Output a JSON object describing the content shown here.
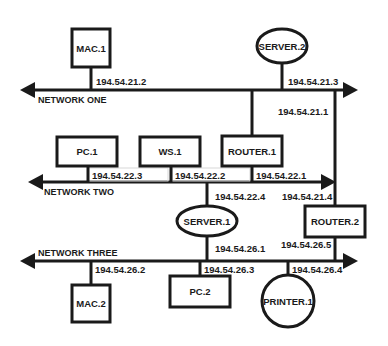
{
  "diagram": {
    "type": "network-topology",
    "colors": {
      "stroke": "#1a1a1a",
      "background": "#ffffff"
    },
    "networks": [
      {
        "id": "net1",
        "label": "NETWORK ONE"
      },
      {
        "id": "net2",
        "label": "NETWORK TWO"
      },
      {
        "id": "net3",
        "label": "NETWORK THREE"
      }
    ],
    "nodes": {
      "mac1": {
        "label": "MAC.1",
        "shape": "rectangle"
      },
      "server2": {
        "label": "SERVER.2",
        "shape": "ellipse"
      },
      "pc1": {
        "label": "PC.1",
        "shape": "rectangle"
      },
      "ws1": {
        "label": "WS.1",
        "shape": "rectangle"
      },
      "router1": {
        "label": "ROUTER.1",
        "shape": "rectangle"
      },
      "server1": {
        "label": "SERVER.1",
        "shape": "ellipse"
      },
      "router2": {
        "label": "ROUTER.2",
        "shape": "rectangle"
      },
      "mac2": {
        "label": "MAC.2",
        "shape": "rectangle"
      },
      "pc2": {
        "label": "PC.2",
        "shape": "rectangle"
      },
      "printer1": {
        "label": "PRINTER.1",
        "shape": "circle"
      }
    },
    "addresses": {
      "mac1_net1": "194.54.21.2",
      "server2_net1": "194.54.21.3",
      "router1_net1": "194.54.21.1",
      "router2_net1": "194.54.21.4",
      "pc1_net2": "194.54.22.3",
      "ws1_net2": "194.54.22.2",
      "router1_net2": "194.54.22.1",
      "server1_net2": "194.54.22.4",
      "server1_net3": "194.54.26.1",
      "router2_net3": "194.54.26.5",
      "mac2_net3": "194.54.26.2",
      "pc2_net3": "194.54.26.3",
      "printer1_net3": "194.54.26.4"
    }
  }
}
